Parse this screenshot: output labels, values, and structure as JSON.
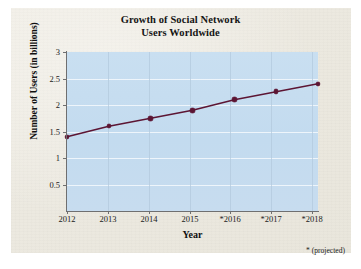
{
  "figure": {
    "footnote": "* (projected)",
    "paper_color": "#ece9e0",
    "plot_background": "#c5dcef",
    "series_color": "#5c1533",
    "grid_color": "#eef5fb",
    "axis_color": "#6f6f70"
  },
  "chart_data": {
    "type": "line",
    "title": "Growth of Social Network Users Worldwide",
    "title_line1": "Growth of Social Network",
    "title_line2": "Users Worldwide",
    "xlabel": "Year",
    "ylabel": "Number of Users (in billions)",
    "categories": [
      "2012",
      "2013",
      "2014",
      "2015",
      "*2016",
      "*2017",
      "*2018"
    ],
    "x": [
      2012,
      2013,
      2014,
      2015,
      2016,
      2017,
      2018
    ],
    "values": [
      1.4,
      1.6,
      1.75,
      1.9,
      2.1,
      2.25,
      2.4
    ],
    "series": [
      {
        "name": "Social network users worldwide",
        "values": [
          1.4,
          1.6,
          1.75,
          1.9,
          2.1,
          2.25,
          2.4
        ]
      }
    ],
    "ylim": [
      0,
      3
    ],
    "yticks": [
      0.5,
      1,
      1.5,
      2,
      2.5,
      3
    ],
    "ytick_labels": [
      "0.5",
      "1",
      "1.5",
      "2",
      "2.5",
      "3"
    ],
    "xtick_labels": [
      "2012",
      "2013",
      "2014",
      "2015",
      "*2016",
      "*2017",
      "*2018"
    ],
    "grid": true,
    "legend": "none",
    "annotation": "* (projected)",
    "marker": "circle",
    "line_color": "#5c1533"
  }
}
